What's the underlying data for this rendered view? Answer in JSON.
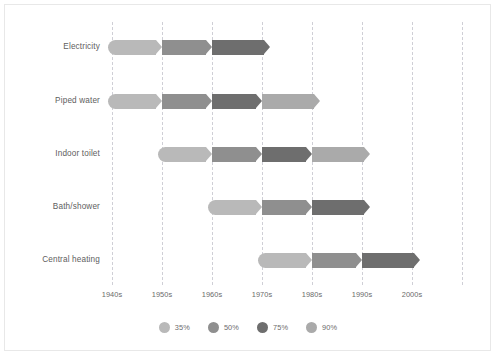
{
  "chart_data": {
    "type": "bar",
    "title": "",
    "subtitle": "",
    "xlabel": "",
    "ylabel": "",
    "grid": true,
    "legend_position": "bottom",
    "x_tick_labels": [
      "1940s",
      "1950s",
      "1960s",
      "1970s",
      "1980s",
      "1990s",
      "2000s"
    ],
    "x_tick_values": [
      1940,
      1950,
      1960,
      1970,
      1980,
      1990,
      2000
    ],
    "xlim": [
      1935,
      2015
    ],
    "categories": [
      "Electricity",
      "Piped water",
      "Indoor toilet",
      "Bath/shower",
      "Central heating"
    ],
    "thresholds": [
      {
        "label": "35%",
        "value": 35,
        "color": "#b9b9b9"
      },
      {
        "label": "50%",
        "value": 50,
        "color": "#8f8f8f"
      },
      {
        "label": "75%",
        "value": 75,
        "color": "#6e6e6e"
      },
      {
        "label": "90%",
        "value": 90,
        "color": "#aaaaaa"
      }
    ],
    "series": [
      {
        "name": "Electricity",
        "segments": [
          {
            "threshold": "35%",
            "start_decade": "1940s",
            "end_decade": "1950s"
          },
          {
            "threshold": "50%",
            "start_decade": "1950s",
            "end_decade": "1960s"
          },
          {
            "threshold": "75%",
            "start_decade": "1960s",
            "end_decade": "1970s"
          }
        ]
      },
      {
        "name": "Piped water",
        "segments": [
          {
            "threshold": "35%",
            "start_decade": "1940s",
            "end_decade": "1950s"
          },
          {
            "threshold": "50%",
            "start_decade": "1950s",
            "end_decade": "1960s"
          },
          {
            "threshold": "75%",
            "start_decade": "1960s",
            "end_decade": "1970s"
          },
          {
            "threshold": "90%",
            "start_decade": "1970s",
            "end_decade": "1980s"
          }
        ]
      },
      {
        "name": "Indoor toilet",
        "segments": [
          {
            "threshold": "35%",
            "start_decade": "1950s",
            "end_decade": "1960s"
          },
          {
            "threshold": "50%",
            "start_decade": "1960s",
            "end_decade": "1970s"
          },
          {
            "threshold": "75%",
            "start_decade": "1970s",
            "end_decade": "1980s"
          },
          {
            "threshold": "90%",
            "start_decade": "1980s",
            "end_decade": "1990s"
          }
        ]
      },
      {
        "name": "Bath/shower",
        "segments": [
          {
            "threshold": "35%",
            "start_decade": "1960s",
            "end_decade": "1970s"
          },
          {
            "threshold": "50%",
            "start_decade": "1970s",
            "end_decade": "1980s"
          },
          {
            "threshold": "75%",
            "start_decade": "1980s",
            "end_decade": "1990s"
          }
        ]
      },
      {
        "name": "Central heating",
        "segments": [
          {
            "threshold": "35%",
            "start_decade": "1970s",
            "end_decade": "1980s"
          },
          {
            "threshold": "50%",
            "start_decade": "1980s",
            "end_decade": "1990s"
          },
          {
            "threshold": "75%",
            "start_decade": "1990s",
            "end_decade": "2000s"
          }
        ]
      }
    ]
  },
  "layout": {
    "grid_x_positions": [
      112,
      162,
      212,
      262,
      312,
      362,
      412,
      462
    ],
    "tick_x_positions": [
      112,
      162,
      212,
      262,
      312,
      362,
      412
    ],
    "row_y_positions": [
      40,
      94,
      147,
      200,
      253
    ],
    "label_right_edge": 100,
    "bar_height": 15
  }
}
